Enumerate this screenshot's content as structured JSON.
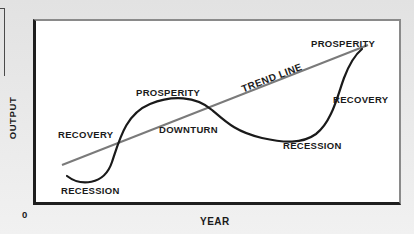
{
  "diagram": {
    "axes": {
      "y_label": "OUTPUT",
      "x_label": "YEAR",
      "origin_label": "0"
    },
    "trend_line": {
      "label": "TREND LINE",
      "color": "#7a7a7a"
    },
    "curve": {
      "color": "#1a1a1a"
    },
    "phase_labels": [
      {
        "id": "recession-1",
        "text": "RECESSION"
      },
      {
        "id": "recovery-1",
        "text": "RECOVERY"
      },
      {
        "id": "prosperity-1",
        "text": "PROSPERITY"
      },
      {
        "id": "downturn-1",
        "text": "DOWNTURN"
      },
      {
        "id": "recession-2",
        "text": "RECESSION"
      },
      {
        "id": "recovery-2",
        "text": "RECOVERY"
      },
      {
        "id": "prosperity-2",
        "text": "PROSPERITY"
      }
    ],
    "colors": {
      "background": "#e8e8e8",
      "plot_background": "#ffffff",
      "axis": "#1e1e1e",
      "frame_light": "#8a8a8a",
      "text": "#1a1a1a"
    }
  }
}
